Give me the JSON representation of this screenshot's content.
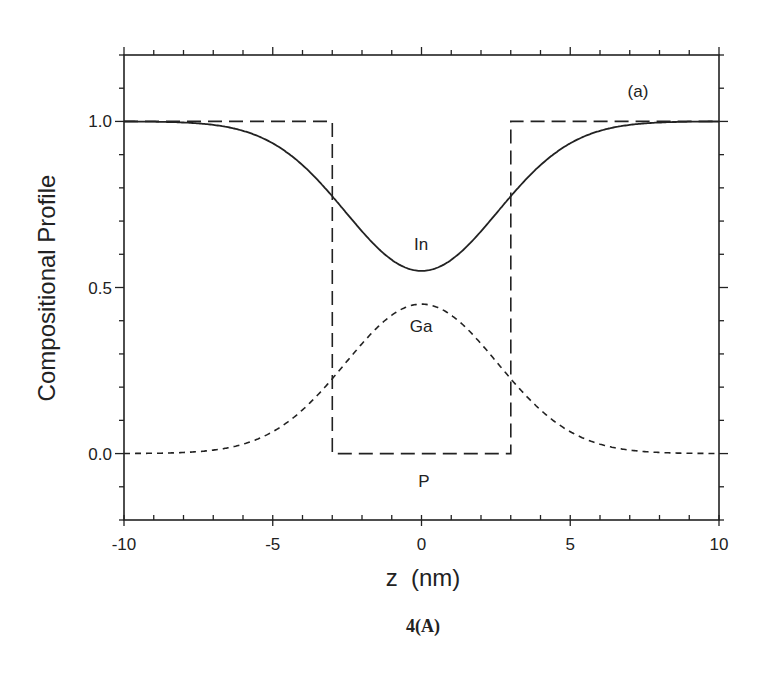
{
  "chart_data": {
    "type": "line",
    "title": "",
    "panel_label": "(a)",
    "caption": "4(A)",
    "xlabel": "z  (nm)",
    "ylabel": "Compositional Profile",
    "xlim": [
      -10,
      10
    ],
    "ylim": [
      -0.2,
      1.2
    ],
    "x_ticks": [
      "-10",
      "-5",
      "0",
      "5",
      "10"
    ],
    "y_ticks": [
      "0.0",
      "0.5",
      "1.0"
    ],
    "grid": false,
    "legend": "inline annotations",
    "series": [
      {
        "name": "In",
        "style": "solid",
        "model": "1 - 0.45*exp(-z^2/(2*2.55^2))",
        "x": [
          -10,
          -8,
          -6,
          -5,
          -4,
          -3,
          -2,
          -1,
          0,
          1,
          2,
          3,
          4,
          5,
          6,
          8,
          10
        ],
        "values": [
          1.0,
          1.0,
          0.99,
          0.97,
          0.9,
          0.78,
          0.67,
          0.58,
          0.55,
          0.58,
          0.67,
          0.78,
          0.9,
          0.97,
          0.99,
          1.0,
          1.0
        ]
      },
      {
        "name": "Ga",
        "style": "short-dash",
        "model": "0.45*exp(-z^2/(2*2.55^2))",
        "x": [
          -10,
          -8,
          -6,
          -5,
          -4,
          -3,
          -2,
          -1,
          0,
          1,
          2,
          3,
          4,
          5,
          6,
          8,
          10
        ],
        "values": [
          0.0,
          0.0,
          0.01,
          0.03,
          0.1,
          0.22,
          0.33,
          0.42,
          0.45,
          0.42,
          0.33,
          0.22,
          0.1,
          0.03,
          0.01,
          0.0,
          0.0
        ]
      },
      {
        "name": "P",
        "style": "long-dash",
        "model": "square well, 0 for |z|<3 else 1",
        "x": [
          -10,
          -3,
          -3,
          3,
          3,
          10
        ],
        "values": [
          1.0,
          1.0,
          0.0,
          0.0,
          1.0,
          1.0
        ]
      }
    ],
    "annotations": [
      {
        "text": "In",
        "x": 0,
        "y": 0.63
      },
      {
        "text": "Ga",
        "x": 0,
        "y": 0.36
      },
      {
        "text": "P",
        "x": 0,
        "y": -0.07
      },
      {
        "text": "(a)",
        "x": 6.5,
        "y": 1.09
      }
    ]
  }
}
